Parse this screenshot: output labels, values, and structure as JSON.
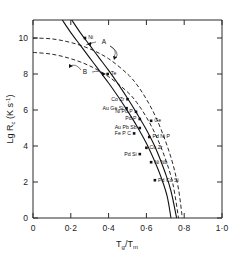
{
  "chart_data": {
    "type": "scatter",
    "title": "",
    "xlabel": "Tg/Tm",
    "ylabel": "Lg Rc (K s-1)",
    "xlim": [
      0,
      1.0
    ],
    "ylim": [
      0,
      11
    ],
    "grid": false,
    "legend": "none",
    "xticks": [
      "0",
      "0·2",
      "0·4",
      "0·6",
      "0·8",
      "1·0"
    ],
    "xtick_values": [
      0,
      0.2,
      0.4,
      0.6,
      0.8,
      1.0
    ],
    "yticks": [
      "0",
      "2",
      "4",
      "6",
      "8",
      "10"
    ],
    "ytick_values": [
      0,
      2,
      4,
      6,
      8,
      10
    ],
    "curves": [
      {
        "name": "A",
        "style": "dashed",
        "label": "A",
        "points": [
          [
            0.0,
            10.0
          ],
          [
            0.1,
            9.95
          ],
          [
            0.2,
            9.75
          ],
          [
            0.3,
            9.4
          ],
          [
            0.4,
            8.85
          ],
          [
            0.5,
            8.0
          ],
          [
            0.55,
            7.4
          ],
          [
            0.6,
            6.6
          ],
          [
            0.65,
            5.6
          ],
          [
            0.7,
            4.3
          ],
          [
            0.74,
            3.0
          ],
          [
            0.77,
            1.6
          ],
          [
            0.79,
            0.0
          ]
        ]
      },
      {
        "name": "B",
        "style": "dashed",
        "label": "B",
        "points": [
          [
            0.0,
            9.2
          ],
          [
            0.1,
            9.1
          ],
          [
            0.2,
            8.85
          ],
          [
            0.3,
            8.45
          ],
          [
            0.4,
            7.85
          ],
          [
            0.5,
            7.0
          ],
          [
            0.55,
            6.4
          ],
          [
            0.6,
            5.6
          ],
          [
            0.65,
            4.6
          ],
          [
            0.7,
            3.3
          ],
          [
            0.74,
            1.9
          ],
          [
            0.77,
            0.0
          ]
        ]
      },
      {
        "name": "solid-left",
        "style": "solid",
        "label": "",
        "points": [
          [
            0.155,
            11.0
          ],
          [
            0.2,
            10.3
          ],
          [
            0.25,
            9.6
          ],
          [
            0.3,
            8.9
          ],
          [
            0.35,
            8.2
          ],
          [
            0.4,
            7.5
          ],
          [
            0.45,
            6.75
          ],
          [
            0.5,
            5.95
          ],
          [
            0.55,
            5.1
          ],
          [
            0.6,
            4.15
          ],
          [
            0.65,
            3.0
          ],
          [
            0.68,
            2.2
          ],
          [
            0.71,
            1.2
          ],
          [
            0.73,
            0.0
          ]
        ]
      },
      {
        "name": "solid-right",
        "style": "solid",
        "label": "",
        "points": [
          [
            0.205,
            11.0
          ],
          [
            0.25,
            10.3
          ],
          [
            0.3,
            9.6
          ],
          [
            0.35,
            8.9
          ],
          [
            0.4,
            8.2
          ],
          [
            0.45,
            7.45
          ],
          [
            0.5,
            6.65
          ],
          [
            0.55,
            5.8
          ],
          [
            0.6,
            4.9
          ],
          [
            0.65,
            3.85
          ],
          [
            0.7,
            2.5
          ],
          [
            0.73,
            1.5
          ],
          [
            0.76,
            0.0
          ]
        ]
      }
    ],
    "points": [
      {
        "label": "Ni",
        "x": 0.275,
        "y": 10.0
      },
      {
        "label": "Te",
        "x": 0.395,
        "y": 8.0
      },
      {
        "label": "Co Zr",
        "x": 0.5,
        "y": 6.6
      },
      {
        "label": "Au Ge Si",
        "x": 0.495,
        "y": 6.1
      },
      {
        "label": "Ni Pd P",
        "x": 0.545,
        "y": 5.9
      },
      {
        "label": "Pd P",
        "x": 0.565,
        "y": 5.5
      },
      {
        "label": "Ge",
        "x": 0.625,
        "y": 5.4
      },
      {
        "label": "Au Pb Sb",
        "x": 0.565,
        "y": 5.0
      },
      {
        "label": "Fe P C",
        "x": 0.535,
        "y": 4.7
      },
      {
        "label": "Pd Ni P",
        "x": 0.615,
        "y": 4.5
      },
      {
        "label": "Cu Zr",
        "x": 0.6,
        "y": 3.9
      },
      {
        "label": "Pd Si",
        "x": 0.565,
        "y": 3.55
      },
      {
        "label": "Ni Nb",
        "x": 0.625,
        "y": 3.1
      },
      {
        "label": "Pd Cu Si",
        "x": 0.645,
        "y": 2.1
      }
    ]
  },
  "annotations": {
    "curve_a_label": "A",
    "curve_b_label": "B"
  },
  "axis": {
    "y_title_main": "Lg R",
    "y_title_sub": "c",
    "y_title_unit": "(K s",
    "y_title_sup": "-1",
    "y_title_close": ")",
    "x_title_t1": "T",
    "x_title_sub1": "g",
    "x_title_slash": "/",
    "x_title_t2": "T",
    "x_title_sub2": "m"
  }
}
